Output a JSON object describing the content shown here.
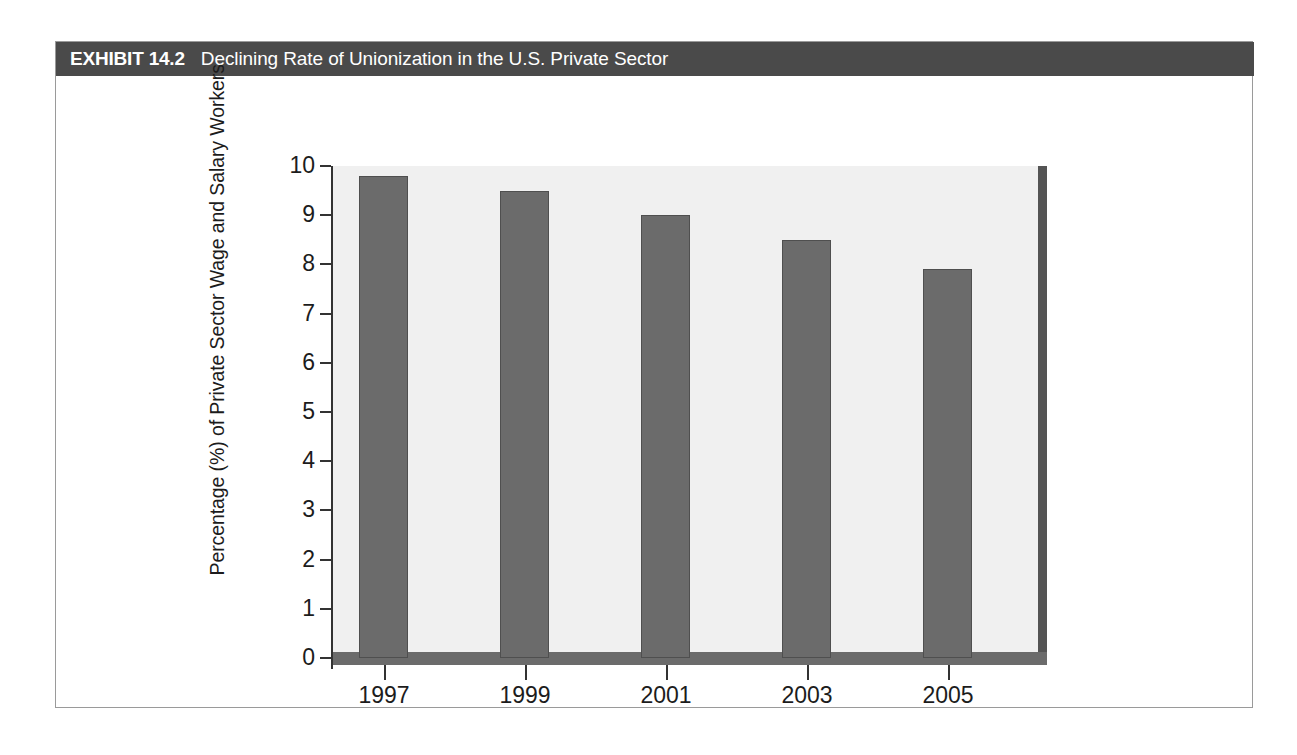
{
  "exhibit": {
    "number": "EXHIBIT 14.2",
    "title": "Declining Rate of Unionization in the U.S. Private Sector"
  },
  "colors": {
    "header_bg": "#4a4a4a",
    "header_text": "#ffffff",
    "bar_fill": "#6b6b6b",
    "plot_bg": "#f0f0f0",
    "axis": "#333333",
    "frame_border": "#9a9a9a"
  },
  "chart_data": {
    "type": "bar",
    "title": "Declining Rate of Unionization in the U.S. Private Sector",
    "categories": [
      "1997",
      "1999",
      "2001",
      "2003",
      "2005"
    ],
    "values": [
      9.8,
      9.5,
      9.0,
      8.5,
      7.9
    ],
    "xlabel": "",
    "ylabel": "Percentage (%) of Private Sector Wage and Salary Workers",
    "ylim": [
      0,
      10
    ],
    "yticks": [
      "0",
      "1",
      "2",
      "3",
      "4",
      "5",
      "6",
      "7",
      "8",
      "9",
      "10"
    ],
    "grid": false,
    "legend": null
  }
}
